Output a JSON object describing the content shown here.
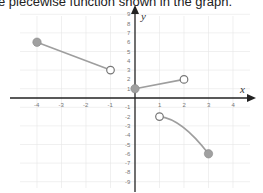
{
  "caption": "e piecewise function shown in the graph.",
  "chart_data": {
    "type": "line",
    "title": "",
    "xlabel": "x",
    "ylabel": "y",
    "xlim": [
      -4.5,
      4.5
    ],
    "ylim": [
      -9.5,
      9.5
    ],
    "grid": true,
    "x_ticks": [
      -4,
      -3,
      -2,
      -1,
      1,
      2,
      3,
      4
    ],
    "y_ticks": [
      -9,
      -8,
      -7,
      -6,
      -5,
      -4,
      -3,
      -2,
      -1,
      1,
      2,
      3,
      4,
      5,
      6,
      7,
      8,
      9
    ],
    "series": [
      {
        "name": "piece-1",
        "kind": "segment",
        "points": [
          [
            -4,
            6
          ],
          [
            -1,
            3
          ]
        ],
        "start": "closed",
        "end": "open"
      },
      {
        "name": "piece-2",
        "kind": "segment",
        "points": [
          [
            0,
            1
          ],
          [
            2,
            2
          ]
        ],
        "start": "closed",
        "end": "open"
      },
      {
        "name": "piece-3",
        "kind": "curve",
        "points": [
          [
            1,
            -2
          ],
          [
            3,
            -6
          ]
        ],
        "start": "open",
        "end": "closed"
      }
    ],
    "colors": {
      "line": "#9e9e9e",
      "axis": "#222222",
      "grid": "#e6e6e6",
      "filled_point": "#a0a0a0"
    }
  }
}
